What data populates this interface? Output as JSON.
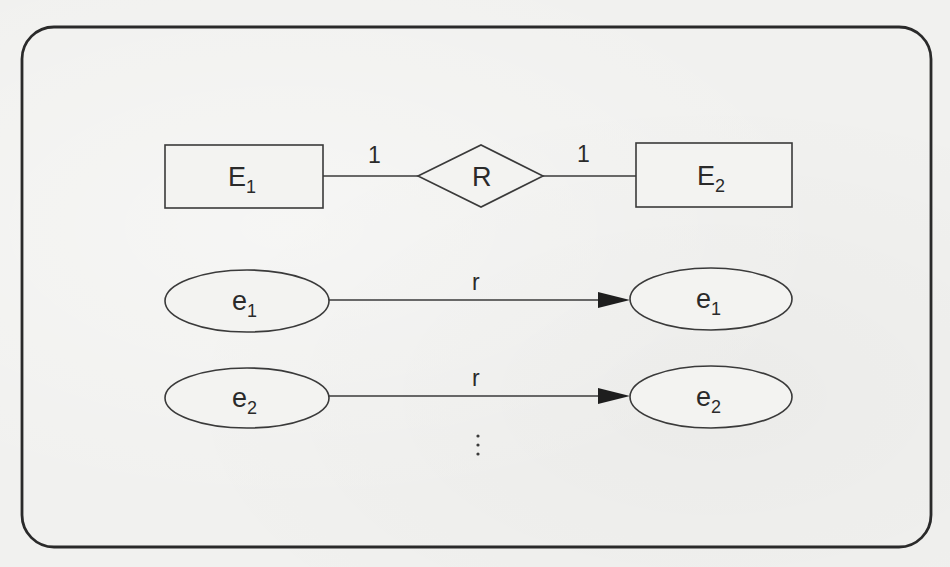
{
  "diagram": {
    "type": "er-diagram-1-to-1-relationship",
    "schema": {
      "entity_left": {
        "label": "E",
        "subscript": "1"
      },
      "relationship": {
        "label": "R"
      },
      "entity_right": {
        "label": "E",
        "subscript": "2"
      },
      "cardinality_left": "1",
      "cardinality_right": "1"
    },
    "instances": [
      {
        "source": {
          "label": "e",
          "subscript": "1"
        },
        "relation_label": "r",
        "target": {
          "label": "e",
          "subscript": "1"
        }
      },
      {
        "source": {
          "label": "e",
          "subscript": "2"
        },
        "relation_label": "r",
        "target": {
          "label": "e",
          "subscript": "2"
        }
      }
    ],
    "continuation": "⋮"
  },
  "colors": {
    "stroke": "#3a3a3a",
    "frame": "#2a2a2a",
    "background": "#f1f1ef"
  }
}
